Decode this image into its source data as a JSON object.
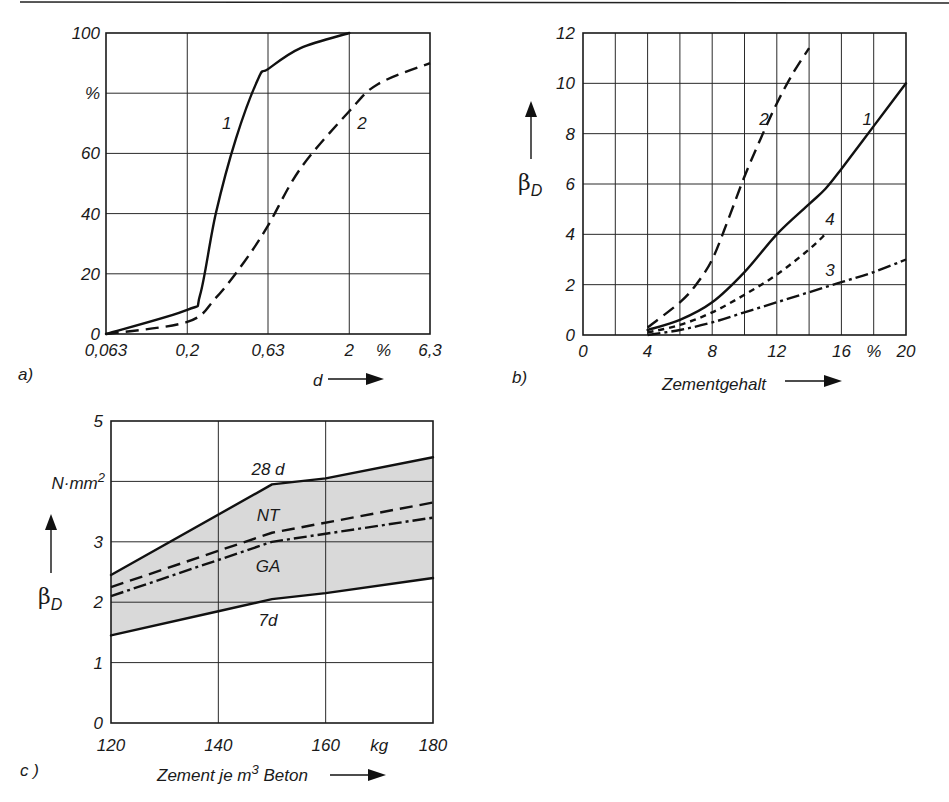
{
  "page": {
    "top_rule": true
  },
  "chart_data": [
    {
      "id": "a",
      "panel_label": "a)",
      "type": "line",
      "title": "",
      "xlabel": "d",
      "ylabel": "%",
      "x_scale": "log",
      "x_ticks": [
        "0,063",
        "0,2",
        "0,63",
        "2",
        "6,3"
      ],
      "x_unit_label": "%",
      "y_ticks": [
        "0",
        "20",
        "40",
        "60",
        "%",
        "100"
      ],
      "xlim": [
        0.063,
        6.3
      ],
      "ylim": [
        0,
        100
      ],
      "grid": true,
      "series": [
        {
          "name": "1",
          "style": "solid",
          "x": [
            0.063,
            0.2,
            0.24,
            0.3,
            0.4,
            0.55,
            0.63,
            1.0,
            2.0
          ],
          "y": [
            0,
            8,
            13,
            40,
            65,
            85,
            88,
            95,
            100
          ]
        },
        {
          "name": "2",
          "style": "dashed",
          "x": [
            0.063,
            0.2,
            0.3,
            0.45,
            0.63,
            1.0,
            2.0,
            3.0,
            6.3
          ],
          "y": [
            0,
            4,
            12,
            24,
            36,
            55,
            74,
            83,
            90
          ]
        }
      ],
      "annotations": [
        {
          "text": "1",
          "x": 0.35,
          "y": 70
        },
        {
          "text": "2",
          "x": 2.4,
          "y": 70
        }
      ]
    },
    {
      "id": "b",
      "panel_label": "b)",
      "type": "line",
      "title": "",
      "xlabel": "Zementgehalt",
      "ylabel": "βD",
      "x_ticks": [
        "0",
        "4",
        "8",
        "12",
        "16",
        "%",
        "20"
      ],
      "y_ticks": [
        "0",
        "2",
        "4",
        "6",
        "8",
        "10",
        "12"
      ],
      "xlim": [
        0,
        20
      ],
      "ylim": [
        0,
        12
      ],
      "grid": true,
      "series": [
        {
          "name": "1",
          "style": "solid",
          "x": [
            4,
            6,
            8,
            10,
            12,
            14,
            15,
            16,
            18,
            20
          ],
          "y": [
            0.2,
            0.6,
            1.3,
            2.5,
            4.0,
            5.2,
            5.8,
            6.6,
            8.3,
            10.0
          ]
        },
        {
          "name": "2",
          "style": "dashed",
          "x": [
            4,
            6,
            7,
            8,
            9,
            10,
            11,
            12,
            13,
            14
          ],
          "y": [
            0.3,
            1.3,
            2.0,
            3.0,
            4.6,
            6.3,
            7.8,
            9.2,
            10.4,
            11.4
          ]
        },
        {
          "name": "3",
          "style": "dash-dot",
          "x": [
            4,
            6,
            8,
            10,
            12,
            14,
            16,
            18,
            20
          ],
          "y": [
            0.0,
            0.2,
            0.5,
            0.9,
            1.3,
            1.7,
            2.1,
            2.5,
            3.0
          ]
        },
        {
          "name": "4",
          "style": "dotted",
          "x": [
            4,
            6,
            8,
            10,
            12,
            14,
            15
          ],
          "y": [
            0.1,
            0.4,
            0.9,
            1.6,
            2.4,
            3.4,
            4.0
          ]
        }
      ],
      "annotations": [
        {
          "text": "2",
          "x": 11.2,
          "y": 8.6
        },
        {
          "text": "1",
          "x": 17.6,
          "y": 8.6
        },
        {
          "text": "4",
          "x": 15.3,
          "y": 4.6
        },
        {
          "text": "3",
          "x": 15.3,
          "y": 2.6
        }
      ]
    },
    {
      "id": "c",
      "panel_label": "c )",
      "type": "area",
      "title": "",
      "xlabel": "Zement je m³ Beton",
      "ylabel": "βD",
      "y_unit_label": "N·mm²",
      "x_ticks": [
        "120",
        "140",
        "160",
        "kg",
        "180"
      ],
      "y_ticks": [
        "0",
        "1",
        "2",
        "3",
        "N·mm²",
        "5"
      ],
      "xlim": [
        120,
        180
      ],
      "ylim": [
        0,
        5
      ],
      "grid": true,
      "band": {
        "upper": "28 d",
        "lower": "7d",
        "fill": "#d9d9d9"
      },
      "series": [
        {
          "name": "28 d",
          "style": "solid",
          "x": [
            120,
            150,
            160,
            180
          ],
          "y": [
            2.45,
            3.95,
            4.05,
            4.4
          ]
        },
        {
          "name": "NT",
          "style": "dashed",
          "x": [
            120,
            150,
            180
          ],
          "y": [
            2.25,
            3.15,
            3.65
          ]
        },
        {
          "name": "GA",
          "style": "dash-dot",
          "x": [
            120,
            150,
            180
          ],
          "y": [
            2.1,
            3.0,
            3.4
          ]
        },
        {
          "name": "7d",
          "style": "solid",
          "x": [
            120,
            140,
            150,
            160,
            180
          ],
          "y": [
            1.45,
            1.85,
            2.05,
            2.15,
            2.4
          ]
        }
      ],
      "annotations": [
        {
          "text": "28 d",
          "x": 150,
          "y": 4.2
        },
        {
          "text": "NT",
          "x": 150,
          "y": 3.45
        },
        {
          "text": "GA",
          "x": 150,
          "y": 2.6
        },
        {
          "text": "7d",
          "x": 150,
          "y": 1.7
        }
      ]
    }
  ]
}
